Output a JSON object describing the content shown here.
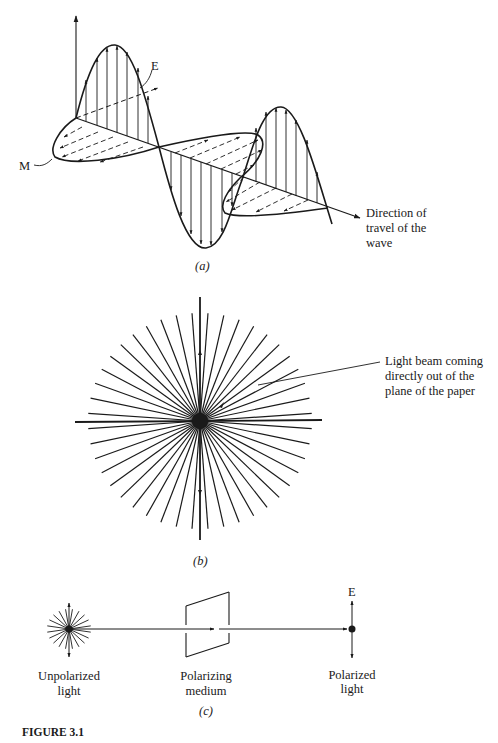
{
  "figure": {
    "title": "FIGURE 3.1",
    "ink_color": "#1a1a1a",
    "background": "#ffffff"
  },
  "panel_a": {
    "caption": "(a)",
    "label_e": "E",
    "label_m": "M",
    "direction_label": [
      "Direction of",
      "travel of the",
      "wave"
    ]
  },
  "panel_b": {
    "caption": "(b)",
    "beam_label": [
      "Light beam coming",
      "directly out of the",
      "plane of the paper"
    ],
    "ray_count": 44
  },
  "panel_c": {
    "caption": "(c)",
    "label_e": "E",
    "source_label": [
      "Unpolarized",
      "light"
    ],
    "medium_label": [
      "Polarizing",
      "medium"
    ],
    "output_label": [
      "Polarized",
      "light"
    ]
  }
}
